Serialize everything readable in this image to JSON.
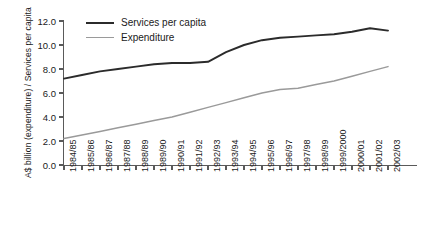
{
  "chart_data": {
    "type": "line",
    "title": "",
    "xlabel": "",
    "ylabel": "A$ billion (expenditure) / Services per capita",
    "ylim": [
      0.0,
      12.0
    ],
    "ytick_values": [
      0.0,
      2.0,
      4.0,
      6.0,
      8.0,
      10.0,
      12.0
    ],
    "ytick_labels": [
      "0.0",
      "2.0",
      "4.0",
      "6.0",
      "8.0",
      "10.0",
      "12.0"
    ],
    "grid": false,
    "legend_position": "top-left-inside",
    "categories": [
      "1984/85",
      "1985/86",
      "1986/87",
      "1987/88",
      "1988/89",
      "1989/90",
      "1990/91",
      "1991/92",
      "1992/93",
      "1993/94",
      "1994/95",
      "1995/96",
      "1996/97",
      "1997/98",
      "1998/99",
      "1999/2000",
      "2000/01",
      "2001/02",
      "2002/03"
    ],
    "series": [
      {
        "name": "Services per capita",
        "color": "#2b2b2b",
        "values": [
          7.2,
          7.5,
          7.8,
          8.0,
          8.2,
          8.4,
          8.5,
          8.5,
          8.6,
          9.4,
          10.0,
          10.4,
          10.6,
          10.7,
          10.8,
          10.9,
          11.1,
          11.4,
          11.2
        ]
      },
      {
        "name": "Expenditure",
        "color": "#9a9a9a",
        "values": [
          2.2,
          2.5,
          2.8,
          3.1,
          3.4,
          3.7,
          4.0,
          4.4,
          4.8,
          5.2,
          5.6,
          6.0,
          6.3,
          6.4,
          6.7,
          7.0,
          7.4,
          7.8,
          8.2
        ]
      }
    ]
  },
  "legend": {
    "entries": [
      {
        "label": "Services per capita"
      },
      {
        "label": "Expenditure"
      }
    ]
  }
}
